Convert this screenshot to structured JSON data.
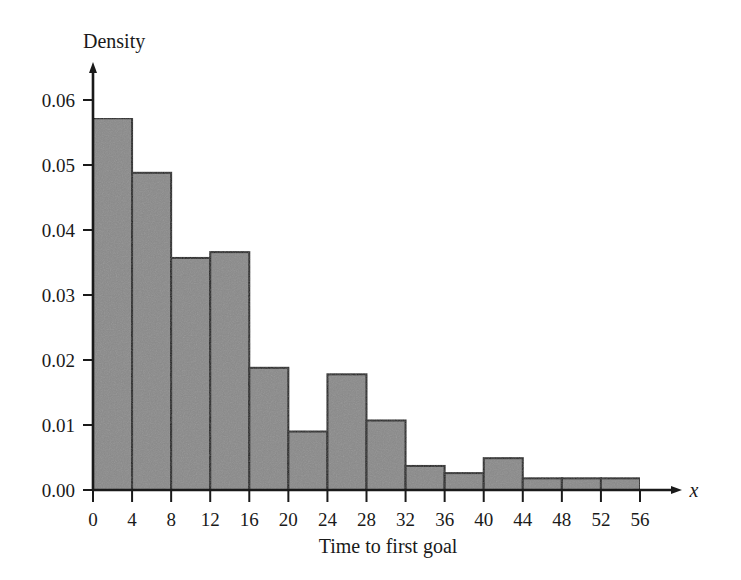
{
  "figure": {
    "name": "histogram-time-to-first-goal",
    "background_color": "#ffffff",
    "bar_fill_color": "#8a8a8a",
    "bar_edge_color": "#1f1f1f",
    "axis_color": "#1a1a1a"
  },
  "chart_data": {
    "type": "bar",
    "title": "",
    "xlabel": "Time to first goal",
    "ylabel": "Density",
    "x_axis_variable": "x",
    "grid": false,
    "legend": false,
    "xlim": [
      0,
      56
    ],
    "ylim": [
      0.0,
      0.06
    ],
    "bin_width": 4,
    "xticks": [
      0,
      4,
      8,
      12,
      16,
      20,
      24,
      28,
      32,
      36,
      40,
      44,
      48,
      52,
      56
    ],
    "xtick_labels": [
      "0",
      "4",
      "8",
      "12",
      "16",
      "20",
      "24",
      "28",
      "32",
      "36",
      "40",
      "44",
      "48",
      "52",
      "56"
    ],
    "yticks": [
      0.0,
      0.01,
      0.02,
      0.03,
      0.04,
      0.05,
      0.06
    ],
    "ytick_labels": [
      "0.00",
      "0.01",
      "0.02",
      "0.03",
      "0.04",
      "0.05",
      "0.06"
    ],
    "bins": [
      {
        "start": 0,
        "end": 4,
        "value": 0.0572
      },
      {
        "start": 4,
        "end": 8,
        "value": 0.0488
      },
      {
        "start": 8,
        "end": 12,
        "value": 0.0357
      },
      {
        "start": 12,
        "end": 16,
        "value": 0.0366
      },
      {
        "start": 16,
        "end": 20,
        "value": 0.0188
      },
      {
        "start": 20,
        "end": 24,
        "value": 0.009
      },
      {
        "start": 24,
        "end": 28,
        "value": 0.0178
      },
      {
        "start": 28,
        "end": 32,
        "value": 0.0107
      },
      {
        "start": 32,
        "end": 36,
        "value": 0.0037
      },
      {
        "start": 36,
        "end": 40,
        "value": 0.0026
      },
      {
        "start": 40,
        "end": 44,
        "value": 0.0049
      },
      {
        "start": 44,
        "end": 48,
        "value": 0.0018
      },
      {
        "start": 48,
        "end": 52,
        "value": 0.0018
      },
      {
        "start": 52,
        "end": 56,
        "value": 0.0018
      }
    ],
    "categories": [
      "0-4",
      "4-8",
      "8-12",
      "12-16",
      "16-20",
      "20-24",
      "24-28",
      "28-32",
      "32-36",
      "36-40",
      "40-44",
      "44-48",
      "48-52",
      "52-56"
    ],
    "values": [
      0.0572,
      0.0488,
      0.0357,
      0.0366,
      0.0188,
      0.009,
      0.0178,
      0.0107,
      0.0037,
      0.0026,
      0.0049,
      0.0018,
      0.0018,
      0.0018
    ]
  }
}
